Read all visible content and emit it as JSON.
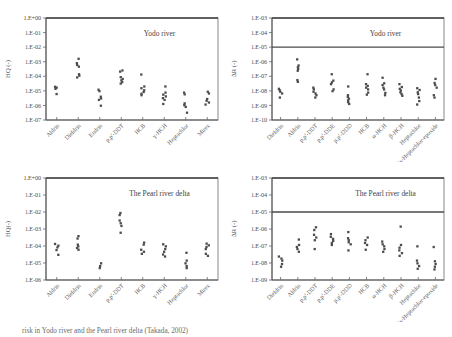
{
  "figure": {
    "caption": "risk in Yodo river and the Pearl river delta (Takada, 2002)",
    "point_color": "#4d4d4d",
    "axis_color": "#555555"
  },
  "chart_data": [
    {
      "id": "yodo-hq",
      "type": "scatter",
      "title": "Yodo river",
      "xlabel": "",
      "ylabel": "HQ (-)",
      "log_y": true,
      "ylim": [
        -7,
        0
      ],
      "yticks": [
        0,
        -1,
        -2,
        -3,
        -4,
        -5,
        -6,
        -7
      ],
      "ytick_labels": [
        "1.E+00",
        "1.E-01",
        "1.E-02",
        "1.E-03",
        "1.E-04",
        "1.E-05",
        "1.E-06",
        "1.E-07"
      ],
      "grid": false,
      "reference_line": null,
      "categories": [
        "Aldrin",
        "Dieldrin",
        "Endrin",
        "p,p'-DDT",
        "HCB",
        "γ-HCH",
        "Heptachlor",
        "Mirex"
      ],
      "series": [
        {
          "name": "Aldrin",
          "values": [
            -4.72,
            -4.78,
            -4.86,
            -5.22
          ]
        },
        {
          "name": "Dieldrin",
          "values": [
            -2.8,
            -3.1,
            -3.22,
            -3.34,
            -3.86,
            -3.96,
            -4.08
          ]
        },
        {
          "name": "Endrin",
          "values": [
            -4.92,
            -5.02,
            -5.4,
            -5.52,
            -5.62,
            -6.02
          ]
        },
        {
          "name": "p,p'-DDT",
          "values": [
            -3.6,
            -3.68,
            -4.06,
            -4.18,
            -4.28,
            -4.4,
            -4.5
          ]
        },
        {
          "name": "HCB",
          "values": [
            -3.88,
            -4.7,
            -4.82,
            -4.96,
            -5.08,
            -5.2,
            -5.3
          ]
        },
        {
          "name": "γ-HCH",
          "values": [
            -4.7,
            -5.12,
            -5.26,
            -5.38,
            -5.5,
            -5.62,
            -5.9
          ]
        },
        {
          "name": "Heptachlor",
          "values": [
            -5.12,
            -5.24,
            -5.86,
            -5.98,
            -6.1,
            -6.5
          ]
        },
        {
          "name": "Mirex",
          "values": [
            -5.06,
            -5.18,
            -5.56,
            -5.68,
            -5.8,
            -5.94
          ]
        }
      ]
    },
    {
      "id": "yodo-dr",
      "type": "scatter",
      "title": "Yodo river",
      "xlabel": "",
      "ylabel": "∆R (-)",
      "log_y": true,
      "ylim": [
        -10,
        -3
      ],
      "yticks": [
        -3,
        -4,
        -5,
        -6,
        -7,
        -8,
        -9,
        -10
      ],
      "ytick_labels": [
        "1.E-03",
        "1.E-04",
        "1.E-05",
        "1.E-06",
        "1.E-07",
        "1.E-08",
        "1.E-09",
        "1.E-10"
      ],
      "grid": false,
      "reference_line": -5,
      "categories": [
        "Dieldrin",
        "Aldrin",
        "p,p'-DDT",
        "p,p'-DDE",
        "p,p'-DDD",
        "HCB",
        "α-HCH",
        "β-HCH",
        "Heptachlor",
        "cis-Heptachlor-epoxide"
      ],
      "series": [
        {
          "name": "Dieldrin",
          "values": [
            -7.86,
            -7.96,
            -8.06,
            -8.18,
            -8.46
          ]
        },
        {
          "name": "Aldrin",
          "values": [
            -5.84,
            -6.26,
            -6.38,
            -6.5,
            -6.62,
            -7.26,
            -7.38
          ]
        },
        {
          "name": "p,p'-DDT",
          "values": [
            -7.78,
            -7.9,
            -8.06,
            -8.18,
            -8.3,
            -8.46
          ]
        },
        {
          "name": "p,p'-DDE",
          "values": [
            -6.86,
            -7.3,
            -7.42,
            -7.54,
            -7.9,
            -8.02
          ]
        },
        {
          "name": "p,p'-DDD",
          "values": [
            -7.7,
            -8.3,
            -8.42,
            -8.54,
            -8.66,
            -8.78,
            -8.9
          ]
        },
        {
          "name": "HCB",
          "values": [
            -6.86,
            -7.54,
            -7.66,
            -7.78,
            -7.9,
            -8.12,
            -8.26
          ]
        },
        {
          "name": "α-HCH",
          "values": [
            -7.1,
            -7.48,
            -7.6,
            -7.78,
            -7.9,
            -8.14,
            -8.3
          ]
        },
        {
          "name": "β-HCH",
          "values": [
            -7.54,
            -7.74,
            -7.86,
            -7.98,
            -8.1,
            -8.22,
            -8.34
          ]
        },
        {
          "name": "Heptachlor",
          "values": [
            -7.82,
            -7.94,
            -8.1,
            -8.22,
            -8.46,
            -8.7,
            -8.94
          ]
        },
        {
          "name": "cis-Heptachlor-epoxide",
          "values": [
            -7.18,
            -7.46,
            -7.6,
            -7.78,
            -8.3,
            -8.46
          ]
        }
      ]
    },
    {
      "id": "pearl-hq",
      "type": "scatter",
      "title": "The Pearl river delta",
      "xlabel": "",
      "ylabel": "HQ(-)",
      "log_y": true,
      "ylim": [
        -6,
        0
      ],
      "yticks": [
        0,
        -1,
        -2,
        -3,
        -4,
        -5,
        -6
      ],
      "ytick_labels": [
        "1.E+00",
        "1.E-01",
        "1.E-02",
        "1.E-03",
        "1.E-04",
        "1.E-05",
        "1.E-06"
      ],
      "grid": false,
      "reference_line": null,
      "categories": [
        "Aldrin",
        "Dieldrin",
        "Endrin",
        "p,p'-DDT",
        "HCB",
        "γ-HCH",
        "Heptachlor",
        "Mirex"
      ],
      "series": [
        {
          "name": "Aldrin",
          "values": [
            -3.88,
            -3.98,
            -4.08,
            -4.24,
            -4.52
          ]
        },
        {
          "name": "Dieldrin",
          "values": [
            -3.42,
            -3.56,
            -3.92,
            -4.02,
            -4.12,
            -4.22
          ]
        },
        {
          "name": "Endrin",
          "values": [
            -5.02,
            -5.18,
            -5.3
          ]
        },
        {
          "name": "p,p'-DDT",
          "values": [
            -2.06,
            -2.18,
            -2.5,
            -2.66,
            -2.82,
            -3.22
          ]
        },
        {
          "name": "HCB",
          "values": [
            -3.8,
            -3.92,
            -4.22,
            -4.34,
            -4.46
          ]
        },
        {
          "name": "γ-HCH",
          "values": [
            -3.9,
            -4.02,
            -4.18,
            -4.34,
            -4.5,
            -4.62
          ]
        },
        {
          "name": "Heptachlor",
          "values": [
            -4.4,
            -4.86,
            -5.02,
            -5.18,
            -5.3
          ]
        },
        {
          "name": "Mirex",
          "values": [
            -3.86,
            -3.96,
            -4.06,
            -4.18,
            -4.46,
            -4.58
          ]
        }
      ]
    },
    {
      "id": "pearl-dr",
      "type": "scatter",
      "title": "The Pearl river delta",
      "xlabel": "",
      "ylabel": "∆R (-)",
      "log_y": true,
      "ylim": [
        -9,
        -3
      ],
      "yticks": [
        -3,
        -4,
        -5,
        -6,
        -7,
        -8,
        -9
      ],
      "ytick_labels": [
        "1.E-03",
        "1.E-04",
        "1.E-05",
        "1.E-06",
        "1.E-07",
        "1.E-08",
        "1.E-09"
      ],
      "grid": false,
      "reference_line": -5,
      "categories": [
        "Dieldrin",
        "Aldrin",
        "p,p'-DDT",
        "p,p'-DDE",
        "p,p'-DDD",
        "HCB",
        "α-HCH",
        "β-HCH",
        "Heptachlor",
        "cis-Heptachlor-epoxide"
      ],
      "series": [
        {
          "name": "Dieldrin",
          "values": [
            -7.62,
            -7.74,
            -7.86,
            -8.06,
            -8.22
          ]
        },
        {
          "name": "Aldrin",
          "values": [
            -6.62,
            -6.94,
            -7.06,
            -7.18,
            -7.34
          ]
        },
        {
          "name": "p,p'-DDT",
          "values": [
            -5.9,
            -6.06,
            -6.34,
            -6.5,
            -6.66,
            -7.18
          ]
        },
        {
          "name": "p,p'-DDE",
          "values": [
            -6.3,
            -6.46,
            -6.58,
            -6.7,
            -6.82,
            -6.94
          ]
        },
        {
          "name": "p,p'-DDD",
          "values": [
            -6.18,
            -6.54,
            -6.66,
            -6.78,
            -6.9,
            -7.26
          ]
        },
        {
          "name": "HCB",
          "values": [
            -6.5,
            -6.66,
            -6.82,
            -6.94,
            -7.22
          ]
        },
        {
          "name": "α-HCH",
          "values": [
            -6.74,
            -6.9,
            -7.02,
            -7.18,
            -7.34
          ]
        },
        {
          "name": "β-HCH",
          "values": [
            -5.86,
            -6.94,
            -7.1,
            -7.26,
            -7.42,
            -7.58
          ]
        },
        {
          "name": "Heptachlor",
          "values": [
            -7.02,
            -7.86,
            -8.02,
            -8.18,
            -8.34
          ]
        },
        {
          "name": "cis-Heptachlor-epoxide",
          "values": [
            -7.06,
            -7.9,
            -8.06,
            -8.22,
            -8.38
          ]
        }
      ]
    }
  ]
}
